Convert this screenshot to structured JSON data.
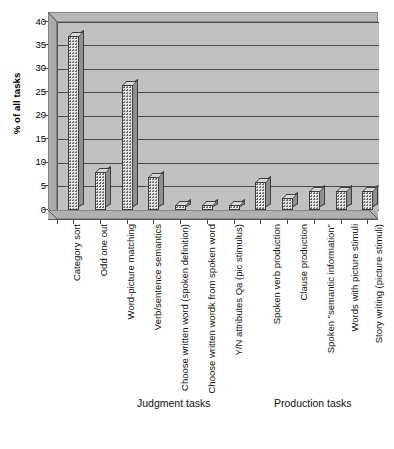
{
  "chart_data": {
    "type": "bar",
    "title": "",
    "subtitle": "",
    "xlabel": "",
    "ylabel": "% of all tasks",
    "ylim": [
      0,
      40
    ],
    "yticks": [
      0,
      5,
      10,
      15,
      20,
      25,
      30,
      35,
      40
    ],
    "ytick_labels": [
      "0",
      "5",
      "10",
      "15",
      "20",
      "25",
      "30",
      "35",
      "40"
    ],
    "grid": true,
    "legend": "none",
    "style": "3d-bar",
    "categories": [
      "Category sort",
      "Odd one out",
      "Word-picture matching",
      "Verb/sentence semantics",
      "Choose written word (spoken definition)",
      "Choose written wordk from spoken word",
      "Y/N attributes Qa (pic stimulus)",
      "Spoken verb production",
      "Clause production",
      "Spoken \"semantic information\"",
      "Words with picture stimuli",
      "Story writing (picture stimuli)"
    ],
    "values": [
      37,
      8,
      26.5,
      7,
      1,
      1,
      1,
      6,
      2.5,
      4,
      4,
      4
    ],
    "groups": [
      {
        "label": "Judgment tasks",
        "categories": [
          "Category sort",
          "Odd one out",
          "Word-picture matching",
          "Verb/sentence semantics",
          "Choose written word (spoken definition)",
          "Choose written wordk from spoken word",
          "Y/N attributes Qa (pic stimulus)"
        ]
      },
      {
        "label": "Production tasks",
        "categories": [
          "Spoken verb production",
          "Clause production",
          "Spoken \"semantic information\"",
          "Words with picture stimuli",
          "Story writing (picture stimuli)"
        ]
      }
    ],
    "colors": {
      "plot_background": "#c0c0c0",
      "bar_fill": "#e8e8e8",
      "bar_outline": "#3d3d3d",
      "gridline": "#4d4d4d",
      "axis": "#4a4a4a",
      "text": "#111111"
    }
  },
  "axis": {
    "y_title": "% of all tasks",
    "y_labels": [
      "40",
      "35",
      "30",
      "25",
      "20",
      "15",
      "10",
      "5",
      "0"
    ]
  },
  "groups": {
    "judgment": "Judgment tasks",
    "production": "Production tasks"
  },
  "categories": {
    "c0": "Category sort",
    "c1": "Odd one out",
    "c2": "Word-picture matching",
    "c3": "Verb/sentence semantics",
    "c4": "Choose written word (spoken definition)",
    "c5": "Choose written wordk from spoken word",
    "c6": "Y/N attributes Qa (pic stimulus)",
    "c7": "Spoken verb production",
    "c8": "Clause production",
    "c9": "Spoken \"semantic information\"",
    "c10": "Words with picture stimuli",
    "c11": "Story writing (picture stimuli)"
  }
}
